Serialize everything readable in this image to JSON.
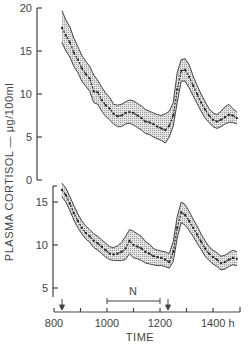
{
  "chart_data": {
    "type": "line",
    "title": "",
    "xlabel": "TIME",
    "ylabel": "PLASMA CORTISOL — μg/100ml",
    "x_unit_suffix": "h",
    "x_ticks": [
      800,
      900,
      1000,
      1100,
      1200,
      1300,
      1400,
      1500
    ],
    "x_tick_labels": [
      "800",
      "1000",
      "1200",
      "1400 h"
    ],
    "xlim": [
      800,
      1500
    ],
    "annotations": {
      "arrows_at": [
        830,
        1230
      ],
      "bracket": {
        "label": "N",
        "from": 1000,
        "to": 1200
      }
    },
    "panels": [
      {
        "name": "upper",
        "y_ticks": [
          0,
          5,
          10,
          15,
          20
        ],
        "ylim": [
          0,
          20
        ],
        "series": [
          {
            "name": "mean",
            "x": [
              830,
              845,
              860,
              875,
              890,
              905,
              920,
              935,
              950,
              965,
              980,
              995,
              1010,
              1025,
              1040,
              1055,
              1070,
              1085,
              1100,
              1115,
              1130,
              1145,
              1160,
              1175,
              1190,
              1205,
              1220,
              1235,
              1250,
              1265,
              1280,
              1295,
              1310,
              1325,
              1340,
              1355,
              1370,
              1385,
              1400,
              1415,
              1430,
              1445,
              1460,
              1475,
              1490
            ],
            "values": [
              17.7,
              16.8,
              16.0,
              14.8,
              14.0,
              13.0,
              12.3,
              11.8,
              10.3,
              10.2,
              9.3,
              8.7,
              8.3,
              7.7,
              7.4,
              7.5,
              7.8,
              7.9,
              7.8,
              7.5,
              7.2,
              6.8,
              6.7,
              6.5,
              6.2,
              6.0,
              5.8,
              6.3,
              7.5,
              10.5,
              12.7,
              12.8,
              12.0,
              11.0,
              10.0,
              9.0,
              8.2,
              7.5,
              7.0,
              6.8,
              7.0,
              7.3,
              7.6,
              7.5,
              7.2
            ],
            "band_upper": [
              19.7,
              18.6,
              17.8,
              16.5,
              15.5,
              14.5,
              13.8,
              13.2,
              12.2,
              11.6,
              10.8,
              10.1,
              9.6,
              8.8,
              8.7,
              8.8,
              9.1,
              9.3,
              9.2,
              8.9,
              8.6,
              8.2,
              8.0,
              7.8,
              7.6,
              7.5,
              7.7,
              8.0,
              9.0,
              12.5,
              14.0,
              14.1,
              13.4,
              12.1,
              11.0,
              10.0,
              9.1,
              8.3,
              7.8,
              7.6,
              8.0,
              8.5,
              8.8,
              8.3,
              7.9
            ],
            "band_lower": [
              16.0,
              15.0,
              14.3,
              13.2,
              12.5,
              11.5,
              10.9,
              10.3,
              9.0,
              8.8,
              8.0,
              7.4,
              7.0,
              6.5,
              6.2,
              6.2,
              6.5,
              6.6,
              6.4,
              6.1,
              5.8,
              5.4,
              5.3,
              5.0,
              4.8,
              4.6,
              4.3,
              5.0,
              6.3,
              9.0,
              11.5,
              11.5,
              10.7,
              9.8,
              8.9,
              8.0,
              7.2,
              6.7,
              6.2,
              6.0,
              6.2,
              6.5,
              6.7,
              6.7,
              6.5
            ]
          }
        ]
      },
      {
        "name": "lower",
        "y_ticks": [
          5,
          10,
          15
        ],
        "ylim": [
          4,
          18
        ],
        "series": [
          {
            "name": "mean",
            "x": [
              830,
              845,
              860,
              875,
              890,
              905,
              920,
              935,
              950,
              965,
              980,
              995,
              1010,
              1025,
              1040,
              1055,
              1070,
              1085,
              1100,
              1115,
              1130,
              1145,
              1160,
              1175,
              1190,
              1205,
              1220,
              1235,
              1250,
              1265,
              1280,
              1295,
              1310,
              1325,
              1340,
              1355,
              1370,
              1385,
              1400,
              1415,
              1430,
              1445,
              1460,
              1475,
              1490
            ],
            "values": [
              16.4,
              15.8,
              14.8,
              13.7,
              12.8,
              12.0,
              11.4,
              11.0,
              10.5,
              10.2,
              9.8,
              9.4,
              9.0,
              8.9,
              9.0,
              9.2,
              9.6,
              10.5,
              10.0,
              9.8,
              9.6,
              9.2,
              9.0,
              8.7,
              8.6,
              8.5,
              8.3,
              8.0,
              9.2,
              12.0,
              13.8,
              13.5,
              12.8,
              12.0,
              11.2,
              10.4,
              9.6,
              9.0,
              8.6,
              8.3,
              7.9,
              8.0,
              8.3,
              8.5,
              8.4
            ],
            "band_upper": [
              17.2,
              16.6,
              15.6,
              14.6,
              13.6,
              12.8,
              12.2,
              11.8,
              11.3,
              11.0,
              10.6,
              10.2,
              9.8,
              9.7,
              9.9,
              10.3,
              11.0,
              11.8,
              11.6,
              11.3,
              11.0,
              10.4,
              10.1,
              9.6,
              9.4,
              9.3,
              9.2,
              9.0,
              10.4,
              13.3,
              15.0,
              14.7,
              13.9,
              13.0,
              12.2,
              11.3,
              10.5,
              9.8,
              9.4,
              9.1,
              8.7,
              8.8,
              9.1,
              9.4,
              9.2
            ],
            "band_lower": [
              15.6,
              15.0,
              14.0,
              12.9,
              12.0,
              11.3,
              10.7,
              10.3,
              9.7,
              9.4,
              9.0,
              8.6,
              8.3,
              8.2,
              8.2,
              8.2,
              8.3,
              9.0,
              8.5,
              8.4,
              8.2,
              7.9,
              7.8,
              7.7,
              7.6,
              7.6,
              7.5,
              7.3,
              8.1,
              10.8,
              12.6,
              12.3,
              11.7,
              11.0,
              10.2,
              9.5,
              8.7,
              8.2,
              7.8,
              7.5,
              7.1,
              7.2,
              7.5,
              7.7,
              7.6
            ]
          }
        ]
      }
    ]
  },
  "labels": {
    "y_title": "PLASMA CORTISOL — μg/100ml",
    "x_title": "TIME",
    "bracket_label": "N",
    "upper_ticks": [
      "20",
      "15",
      "10",
      "5",
      "0"
    ],
    "lower_ticks": [
      "15",
      "10",
      "5"
    ],
    "x_ticks": [
      "800",
      "1000",
      "1200",
      "1400 h"
    ]
  }
}
